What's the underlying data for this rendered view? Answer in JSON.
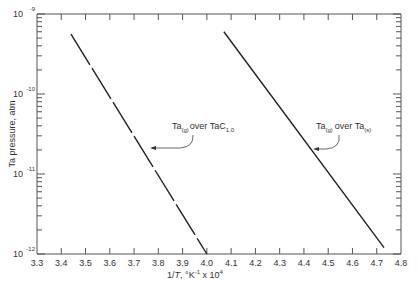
{
  "chart_data": {
    "type": "line",
    "title": "",
    "xlabel": "1/T, °K⁻¹ x 10⁴",
    "ylabel": "Ta pressure, atm",
    "xlim": [
      3.3,
      4.8
    ],
    "ylim": [
      1e-12,
      1e-09
    ],
    "yscale": "log",
    "grid": false,
    "x_ticks": [
      "3.3",
      "3.4",
      "3.5",
      "3.6",
      "3.7",
      "3.8",
      "3.9",
      "4.0",
      "4.1",
      "4.2",
      "4.3",
      "4.4",
      "4.5",
      "4.6",
      "4.7",
      "4.8"
    ],
    "y_ticks": [
      {
        "base": "10",
        "exp": "-9",
        "value": 1e-09
      },
      {
        "base": "10",
        "exp": "-10",
        "value": 1e-10
      },
      {
        "base": "10",
        "exp": "-11",
        "value": 1e-11
      },
      {
        "base": "10",
        "exp": "-12",
        "value": 1e-12
      }
    ],
    "series": [
      {
        "name": "Ta(g) over TaC1.0",
        "style": "long-dash",
        "x": [
          3.44,
          4.0
        ],
        "y": [
          5.6e-10,
          1e-12
        ]
      },
      {
        "name": "Ta(g) over Ta(s)",
        "style": "solid",
        "x": [
          4.07,
          4.73
        ],
        "y": [
          6e-10,
          1.2e-12
        ]
      }
    ],
    "annotations": [
      {
        "text_main": "Ta",
        "sub1": "(g)",
        "mid": "over TaC",
        "sub2": "1.0",
        "points_to_series": 0
      },
      {
        "text_main": "Ta",
        "sub1": "(g)",
        "mid": "over Ta",
        "sub2": "(s)",
        "points_to_series": 1
      }
    ]
  }
}
